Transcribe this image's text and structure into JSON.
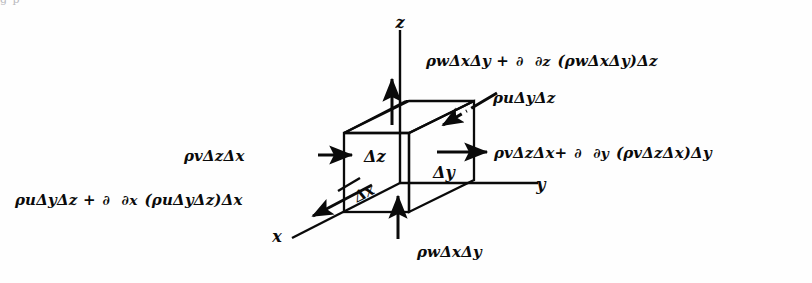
{
  "figure": {
    "background_color": "#fefefe",
    "ink_color": "#0a0a0a",
    "partial_symbol": "∂",
    "delta_symbol": "Δ",
    "rho_symbol": "ρ",
    "top_cropped_text": "g p"
  },
  "axes": [
    {
      "id": "z",
      "label": "z",
      "x": 400,
      "y": 22
    },
    {
      "id": "y",
      "label": "y",
      "x": 541,
      "y": 184
    },
    {
      "id": "x",
      "label": "x",
      "x": 277,
      "y": 236
    }
  ],
  "dimensions": [
    {
      "id": "delta-z",
      "label": "Δz",
      "x": 364,
      "y": 147
    },
    {
      "id": "delta-y",
      "label": "Δy",
      "x": 433,
      "y": 163
    },
    {
      "id": "delta-x",
      "label": "Δx",
      "x": 359,
      "y": 188
    }
  ],
  "flux_labels": [
    {
      "id": "top-outflow",
      "position": "top-right",
      "x": 425,
      "y": 52,
      "font_size": 15,
      "description": "z-direction outflow through top face",
      "parts": [
        {
          "type": "text",
          "value": "ρwΔxΔy +"
        },
        {
          "type": "fraction",
          "numerator": "∂",
          "denominator": "∂z"
        },
        {
          "type": "text",
          "value": "(ρwΔxΔy)Δz"
        }
      ],
      "plain": "ρwΔxΔy + ∂/∂z (ρwΔxΔy)Δz"
    },
    {
      "id": "x-inflow",
      "position": "upper-right",
      "x": 492,
      "y": 89,
      "font_size": 15,
      "description": "x-direction inflow through back face",
      "parts": [
        {
          "type": "text",
          "value": "ρuΔyΔz"
        }
      ],
      "plain": "ρuΔyΔz"
    },
    {
      "id": "y-inflow",
      "position": "middle-left",
      "x": 183,
      "y": 147,
      "font_size": 15,
      "description": "y-direction inflow through left face",
      "parts": [
        {
          "type": "text",
          "value": "ρvΔzΔx"
        }
      ],
      "plain": "ρvΔzΔx"
    },
    {
      "id": "y-outflow",
      "position": "middle-right",
      "x": 493,
      "y": 144,
      "font_size": 15,
      "description": "y-direction outflow through right face",
      "parts": [
        {
          "type": "text",
          "value": "ρvΔzΔx+"
        },
        {
          "type": "fraction",
          "numerator": "∂",
          "denominator": "∂y"
        },
        {
          "type": "text",
          "value": "(ρvΔzΔx)Δy"
        }
      ],
      "plain": "ρvΔzΔx + ∂/∂y (ρvΔzΔx)Δy"
    },
    {
      "id": "x-outflow",
      "position": "lower-left",
      "x": 14,
      "y": 191,
      "font_size": 15,
      "description": "x-direction outflow through front face",
      "parts": [
        {
          "type": "text",
          "value": "ρuΔyΔz +"
        },
        {
          "type": "fraction",
          "numerator": "∂",
          "denominator": "∂x"
        },
        {
          "type": "text",
          "value": "(ρuΔyΔz)Δx"
        }
      ],
      "plain": "ρuΔyΔz + ∂/∂x (ρuΔyΔz)Δx"
    },
    {
      "id": "bottom-inflow",
      "position": "bottom-center",
      "x": 416,
      "y": 243,
      "font_size": 15,
      "description": "z-direction inflow through bottom face",
      "parts": [
        {
          "type": "text",
          "value": "ρwΔxΔy"
        }
      ],
      "plain": "ρwΔxΔy"
    }
  ],
  "arrows": [
    {
      "id": "arrow-top-out",
      "direction": "up",
      "style": "solid"
    },
    {
      "id": "arrow-bottom-in",
      "direction": "up",
      "style": "solid"
    },
    {
      "id": "arrow-left-in",
      "direction": "right",
      "style": "solid"
    },
    {
      "id": "arrow-right-out",
      "direction": "right",
      "style": "solid"
    },
    {
      "id": "arrow-x-in",
      "direction": "down-left",
      "style": "dashed"
    },
    {
      "id": "arrow-x-out",
      "direction": "down-left",
      "style": "solid"
    }
  ]
}
